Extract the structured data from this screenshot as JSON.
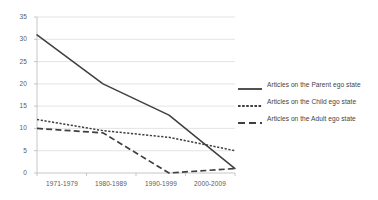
{
  "chart_data": {
    "type": "line",
    "title": "",
    "xlabel": "",
    "ylabel": "",
    "categories": [
      "1971-1979",
      "1980-1989",
      "1990-1999",
      "2000-2009"
    ],
    "ylim": [
      0,
      35
    ],
    "yticks": [
      0,
      5,
      10,
      15,
      20,
      25,
      30,
      35
    ],
    "grid": true,
    "legend_position": "right",
    "series": [
      {
        "name": "Articles on the Parent ego state",
        "style": "solid",
        "color": "#3f3f3f",
        "values": [
          31,
          20,
          13,
          1
        ]
      },
      {
        "name": "Articles on the Child ego state",
        "style": "dotted",
        "color": "#3f3f3f",
        "values": [
          12,
          9.5,
          8,
          5
        ]
      },
      {
        "name": "Articles on the Adult ego state",
        "style": "dashed",
        "color": "#3f3f3f",
        "values": [
          10,
          9,
          0,
          1
        ]
      }
    ]
  },
  "axis": {
    "y_labels": [
      "35",
      "30",
      "25",
      "20",
      "15",
      "10",
      "5",
      "0"
    ],
    "x_labels": [
      "1971-1979",
      "1980-1989",
      "1990-1999",
      "2000-2009"
    ]
  },
  "legend": {
    "items": [
      {
        "label": "Articles on the Parent ego state",
        "style": "solid"
      },
      {
        "label": "Articles on the Child ego state",
        "style": "dotted"
      },
      {
        "label": "Articles on the Adult ego state",
        "style": "dashed"
      }
    ]
  },
  "colors": {
    "line": "#3f3f3f",
    "grid": "#d9d9d9",
    "axis": "#bfbfbf",
    "text": "#5a5a5a"
  }
}
